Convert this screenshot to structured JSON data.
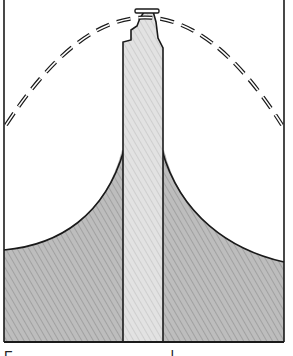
{
  "figure": {
    "colors": {
      "ink": "#1a1a1a",
      "mound_fill": "#b9b9b9",
      "column_fill": "#dcdcdc",
      "background": "#ffffff"
    },
    "elements": [
      {
        "name": "dashed-arch",
        "style": "dashed outline"
      },
      {
        "name": "central-column",
        "style": "light hatched fill"
      },
      {
        "name": "side-mound",
        "style": "dark hatched fill"
      },
      {
        "name": "frame",
        "style": "left, right and bottom border lines"
      }
    ]
  },
  "caption": {
    "text": "F                  l",
    "note": "truncated at image edge, illegible"
  }
}
